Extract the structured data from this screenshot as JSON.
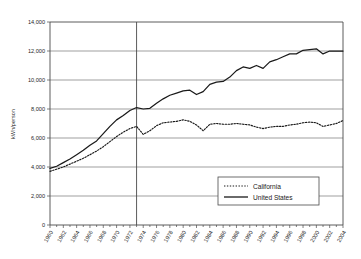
{
  "chart_data": {
    "type": "line",
    "title": "",
    "xlabel": "",
    "ylabel": "kWh/person",
    "ylim": [
      0,
      14000
    ],
    "ytick_values": [
      0,
      2000,
      4000,
      6000,
      8000,
      10000,
      12000,
      14000
    ],
    "ytick_labels": [
      "0",
      "2,000",
      "4,000",
      "6,000",
      "8,000",
      "10,000",
      "12,000",
      "14,000"
    ],
    "xlim": [
      1960,
      2004
    ],
    "xtick_labels": [
      "1960",
      "1962",
      "1964",
      "1966",
      "1968",
      "1970",
      "1972",
      "1974",
      "1976",
      "1978",
      "1980",
      "1982",
      "1984",
      "1986",
      "1988",
      "1990",
      "1992",
      "1994",
      "1996",
      "1998",
      "2000",
      "2002",
      "2004"
    ],
    "grid": "horizontal",
    "legend_position": "lower-right",
    "annotations": [
      {
        "name": "vertical-marker-1973",
        "x": 1973,
        "label": ""
      }
    ],
    "x": [
      1960,
      1961,
      1962,
      1963,
      1964,
      1965,
      1966,
      1967,
      1968,
      1969,
      1970,
      1971,
      1972,
      1973,
      1974,
      1975,
      1976,
      1977,
      1978,
      1979,
      1980,
      1981,
      1982,
      1983,
      1984,
      1985,
      1986,
      1987,
      1988,
      1989,
      1990,
      1991,
      1992,
      1993,
      1994,
      1995,
      1996,
      1997,
      1998,
      1999,
      2000,
      2001,
      2002,
      2003,
      2004
    ],
    "series": [
      {
        "name": "California",
        "style": "dotted",
        "values": [
          3700,
          3850,
          4000,
          4200,
          4400,
          4600,
          4850,
          5100,
          5400,
          5750,
          6100,
          6400,
          6650,
          6800,
          6250,
          6500,
          6850,
          7050,
          7100,
          7150,
          7250,
          7150,
          6900,
          6500,
          6950,
          7000,
          6950,
          6950,
          7000,
          6950,
          6900,
          6750,
          6650,
          6750,
          6800,
          6800,
          6900,
          6950,
          7050,
          7100,
          7050,
          6800,
          6900,
          7000,
          7200
        ]
      },
      {
        "name": "United States",
        "style": "solid",
        "values": [
          3900,
          4050,
          4300,
          4550,
          4850,
          5150,
          5500,
          5800,
          6300,
          6800,
          7250,
          7550,
          7900,
          8100,
          8000,
          8050,
          8400,
          8700,
          8950,
          9100,
          9250,
          9300,
          9000,
          9200,
          9700,
          9850,
          9900,
          10200,
          10650,
          10900,
          10800,
          11000,
          10800,
          11250,
          11400,
          11600,
          11800,
          11800,
          12050,
          12100,
          12150,
          11800,
          12000,
          12000,
          12000
        ]
      }
    ]
  },
  "legend": {
    "entries": [
      {
        "label": "California",
        "style": "dotted"
      },
      {
        "label": "United States",
        "style": "solid"
      }
    ]
  }
}
